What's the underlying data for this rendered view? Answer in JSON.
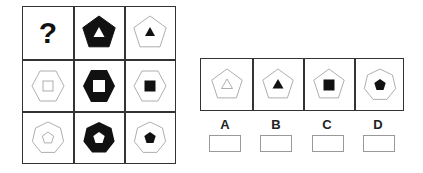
{
  "puzzle": {
    "grid": {
      "rows": 3,
      "cols": 3,
      "cells": [
        {
          "row": 0,
          "col": 0,
          "type": "question",
          "text": "?"
        },
        {
          "row": 0,
          "col": 1,
          "outer": "pentagon",
          "outer_fill": "black",
          "inner": "triangle",
          "inner_fill": "white"
        },
        {
          "row": 0,
          "col": 2,
          "outer": "pentagon",
          "outer_fill": "white",
          "inner": "triangle",
          "inner_fill": "black"
        },
        {
          "row": 1,
          "col": 0,
          "outer": "hexagon",
          "outer_fill": "white",
          "inner": "square",
          "inner_fill": "white"
        },
        {
          "row": 1,
          "col": 1,
          "outer": "hexagon",
          "outer_fill": "black",
          "inner": "square",
          "inner_fill": "white"
        },
        {
          "row": 1,
          "col": 2,
          "outer": "hexagon",
          "outer_fill": "white",
          "inner": "square",
          "inner_fill": "black"
        },
        {
          "row": 2,
          "col": 0,
          "outer": "heptagon",
          "outer_fill": "white",
          "inner": "pentagon",
          "inner_fill": "white"
        },
        {
          "row": 2,
          "col": 1,
          "outer": "heptagon",
          "outer_fill": "black",
          "inner": "pentagon",
          "inner_fill": "white"
        },
        {
          "row": 2,
          "col": 2,
          "outer": "heptagon",
          "outer_fill": "white",
          "inner": "pentagon",
          "inner_fill": "black"
        }
      ]
    },
    "options": [
      {
        "label": "A",
        "outer": "pentagon",
        "outer_fill": "white",
        "inner": "triangle",
        "inner_fill": "white"
      },
      {
        "label": "B",
        "outer": "pentagon",
        "outer_fill": "white",
        "inner": "triangle",
        "inner_fill": "black"
      },
      {
        "label": "C",
        "outer": "pentagon",
        "outer_fill": "white",
        "inner": "square",
        "inner_fill": "black"
      },
      {
        "label": "D",
        "outer": "heptagon",
        "outer_fill": "white",
        "inner": "pentagon",
        "inner_fill": "black"
      }
    ],
    "colors": {
      "line": "#333333",
      "shape_stroke": "#999999",
      "fill_black": "#111111"
    }
  }
}
